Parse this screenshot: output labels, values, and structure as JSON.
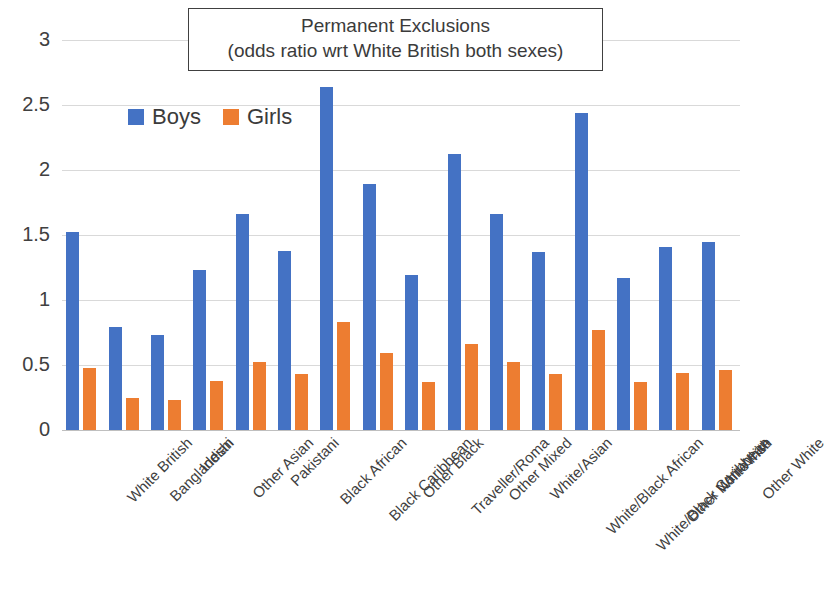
{
  "title": {
    "line1": "Permanent Exclusions",
    "line2": "(odds ratio wrt White British both sexes)"
  },
  "legend": {
    "items": [
      {
        "label": "Boys",
        "color": "#4472c4"
      },
      {
        "label": "Girls",
        "color": "#ed7d31"
      }
    ]
  },
  "axis": {
    "y_ticks": [
      "0",
      "0.5",
      "1",
      "1.5",
      "2",
      "2.5",
      "3"
    ]
  },
  "chart_data": {
    "type": "bar",
    "title": "Permanent Exclusions (odds ratio wrt White British both sexes)",
    "xlabel": "",
    "ylabel": "",
    "ylim": [
      0,
      3
    ],
    "ytick_step": 0.5,
    "grid": true,
    "legend_position": "inside-top-left",
    "categories": [
      "White British",
      "Bangladeshi",
      "Indian",
      "Other Asian",
      "Pakistani",
      "Black African",
      "Black Caribbean",
      "Other Black",
      "Traveller/Roma",
      "Other Mixed",
      "White/Asian",
      "White/Black African",
      "White/Black Caribbean",
      "Other Non-White",
      "White Irish",
      "Other White"
    ],
    "series": [
      {
        "name": "Boys",
        "color": "#4472c4",
        "values": [
          1.52,
          0.79,
          0.73,
          1.23,
          1.66,
          1.38,
          2.64,
          1.89,
          1.19,
          2.12,
          1.66,
          1.37,
          2.44,
          1.17,
          1.41,
          1.45
        ]
      },
      {
        "name": "Girls",
        "color": "#ed7d31",
        "values": [
          0.48,
          0.25,
          0.23,
          0.38,
          0.52,
          0.43,
          0.83,
          0.59,
          0.37,
          0.66,
          0.52,
          0.43,
          0.77,
          0.37,
          0.44,
          0.46
        ]
      }
    ]
  }
}
